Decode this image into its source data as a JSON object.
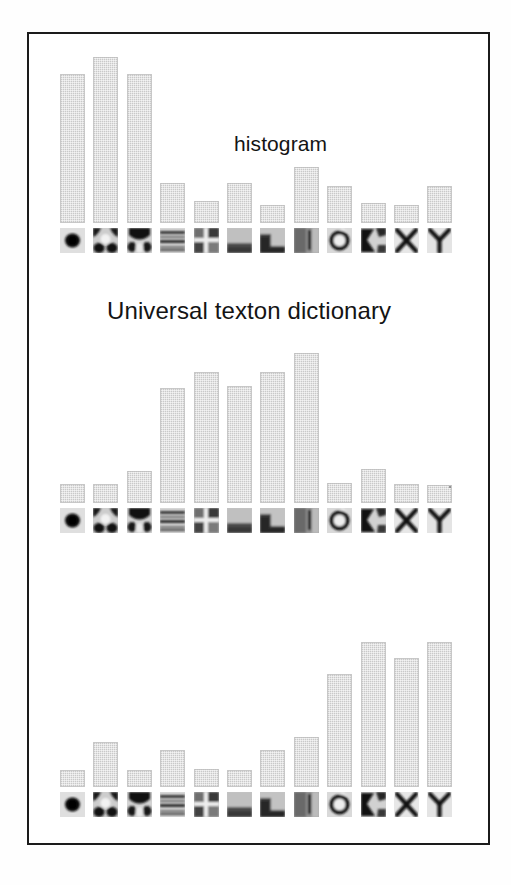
{
  "figure": {
    "background_color": "#ffffff",
    "frame_color": "#1b1b1b",
    "bar_color": "#c9c9c9",
    "texton_background": "#e3e3e3"
  },
  "labels": {
    "histogram": "histogram",
    "dictionary": "Universal texton dictionary"
  },
  "textons": [
    {
      "id": "texton-1",
      "name": "dark-blob-center"
    },
    {
      "id": "texton-2",
      "name": "dark-corners-bright-center"
    },
    {
      "id": "texton-3",
      "name": "dark-arch-top"
    },
    {
      "id": "texton-4",
      "name": "horizontal-stripes"
    },
    {
      "id": "texton-5",
      "name": "cross-quadrant"
    },
    {
      "id": "texton-6",
      "name": "dark-lower-band"
    },
    {
      "id": "texton-7",
      "name": "dark-left-step"
    },
    {
      "id": "texton-8",
      "name": "vertical-bar-right"
    },
    {
      "id": "texton-9",
      "name": "dark-ring"
    },
    {
      "id": "texton-10",
      "name": "dark-wedge-left"
    },
    {
      "id": "texton-11",
      "name": "x-junction"
    },
    {
      "id": "texton-12",
      "name": "y-junction"
    }
  ],
  "chart_data": [
    {
      "id": "histogram-top",
      "type": "bar",
      "title": "histogram",
      "xlabel": "Universal texton dictionary",
      "ylabel": "",
      "ylim": [
        0,
        170
      ],
      "grid": false,
      "legend": "none",
      "categories": [
        "dark-blob-center",
        "dark-corners-bright-center",
        "dark-arch-top",
        "horizontal-stripes",
        "cross-quadrant",
        "dark-lower-band",
        "dark-left-step",
        "vertical-bar-right",
        "dark-ring",
        "dark-wedge-left",
        "x-junction",
        "y-junction"
      ],
      "values": [
        149,
        166,
        149,
        40,
        22,
        40,
        18,
        56,
        37,
        20,
        18,
        37
      ]
    },
    {
      "id": "histogram-middle",
      "type": "bar",
      "title": "",
      "xlabel": "Universal texton dictionary",
      "ylabel": "",
      "ylim": [
        0,
        170
      ],
      "grid": false,
      "legend": "none",
      "categories": [
        "dark-blob-center",
        "dark-corners-bright-center",
        "dark-arch-top",
        "horizontal-stripes",
        "cross-quadrant",
        "dark-lower-band",
        "dark-left-step",
        "vertical-bar-right",
        "dark-ring",
        "dark-wedge-left",
        "x-junction",
        "y-junction"
      ],
      "values": [
        19,
        19,
        32,
        115,
        131,
        117,
        131,
        150,
        20,
        34,
        19,
        18
      ]
    },
    {
      "id": "histogram-bottom",
      "type": "bar",
      "title": "",
      "xlabel": "Universal texton dictionary",
      "ylabel": "",
      "ylim": [
        0,
        170
      ],
      "grid": false,
      "legend": "none",
      "categories": [
        "dark-blob-center",
        "dark-corners-bright-center",
        "dark-arch-top",
        "horizontal-stripes",
        "cross-quadrant",
        "dark-lower-band",
        "dark-left-step",
        "vertical-bar-right",
        "dark-ring",
        "dark-wedge-left",
        "x-junction",
        "y-junction"
      ],
      "values": [
        17,
        45,
        17,
        37,
        18,
        17,
        37,
        50,
        113,
        145,
        129,
        145
      ]
    }
  ],
  "layout": {
    "column_left": 58,
    "column_pitch": 33.4,
    "bar_width": 25,
    "texton_size": 25,
    "panels": [
      {
        "id": "histogram-top",
        "baseline_y": 221,
        "texton_y": 226
      },
      {
        "id": "histogram-middle",
        "baseline_y": 501,
        "texton_y": 506
      },
      {
        "id": "histogram-bottom",
        "baseline_y": 785,
        "texton_y": 790
      }
    ],
    "pixels_per_unit": 1.0
  }
}
